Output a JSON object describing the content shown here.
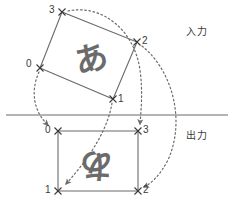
{
  "diagram": {
    "title_input": "入力",
    "title_output": "出力",
    "divider_y": 115,
    "colors": {
      "stroke": "#6b6b6b",
      "dotted": "#6b6b6b",
      "text": "#3a3a3a",
      "glyph": "#6b6b6b",
      "background": "#ffffff"
    },
    "input_quad": {
      "name": "input-quad",
      "glyph": "あ",
      "glyph_rotation_deg": -14,
      "corners": [
        {
          "index": "0",
          "x": 40,
          "y": 68,
          "label_dx": -10,
          "label_dy": -4
        },
        {
          "index": "1",
          "x": 113,
          "y": 99,
          "label_dx": 4,
          "label_dy": -4
        },
        {
          "index": "2",
          "x": 137,
          "y": 42,
          "label_dx": 4,
          "label_dy": -4
        },
        {
          "index": "3",
          "x": 62,
          "y": 12,
          "label_dx": -10,
          "label_dy": -4
        }
      ]
    },
    "output_rect": {
      "name": "output-rect",
      "glyph": "あ",
      "glyph_rotation_deg": 180,
      "corners": [
        {
          "index": "0",
          "x": 58,
          "y": 131,
          "label_dx": -10,
          "label_dy": -4
        },
        {
          "index": "1",
          "x": 58,
          "y": 191,
          "label_dx": -10,
          "label_dy": -4
        },
        {
          "index": "2",
          "x": 138,
          "y": 191,
          "label_dx": 4,
          "label_dy": -4
        },
        {
          "index": "3",
          "x": 138,
          "y": 131,
          "label_dx": 4,
          "label_dy": -4
        }
      ]
    },
    "arrows": [
      {
        "name": "arrow-corner-0",
        "from": "0",
        "to": "0"
      },
      {
        "name": "arrow-corner-1",
        "from": "1",
        "to": "1"
      },
      {
        "name": "arrow-corner-2",
        "from": "2",
        "to": "2"
      },
      {
        "name": "arrow-corner-3",
        "from": "3",
        "to": "3"
      }
    ]
  }
}
